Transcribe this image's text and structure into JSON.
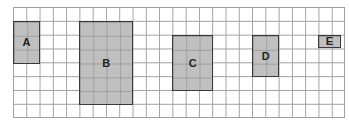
{
  "grid": {
    "columns": 25,
    "rows": 8,
    "line_color": "#a0a0a0"
  },
  "shapes": [
    {
      "label": "A",
      "col": 0,
      "row": 1,
      "width": 2,
      "height": 3
    },
    {
      "label": "B",
      "col": 5,
      "row": 1,
      "width": 4,
      "height": 6
    },
    {
      "label": "C",
      "col": 12,
      "row": 2,
      "width": 3,
      "height": 4
    },
    {
      "label": "D",
      "col": 18,
      "row": 2,
      "width": 2,
      "height": 3
    },
    {
      "label": "E",
      "col": 23,
      "row": 2,
      "width": 1.6,
      "height": 0.85
    }
  ],
  "colors": {
    "fill": "#c0c0c0",
    "border": "#3a3a3a"
  }
}
